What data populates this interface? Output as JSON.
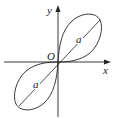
{
  "diagram": {
    "type": "lemniscate",
    "equation_hint": "r^2 = a^2 sin 2θ",
    "axes": {
      "x_label": "x",
      "y_label": "y",
      "origin_label": "O"
    },
    "lobes": [
      {
        "position": "upper-right",
        "label": "a"
      },
      {
        "position": "lower-left",
        "label": "a"
      }
    ],
    "colors": {
      "stroke": "#222222",
      "background": "#ffffff"
    }
  }
}
